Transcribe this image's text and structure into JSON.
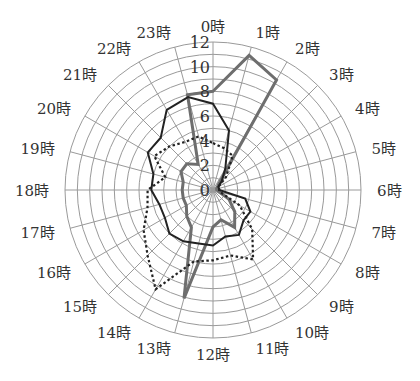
{
  "chart_data": {
    "type": "radar",
    "title": "",
    "categories": [
      "0時",
      "1時",
      "2時",
      "3時",
      "4時",
      "5時",
      "6時",
      "7時",
      "8時",
      "9時",
      "10時",
      "11時",
      "12時",
      "13時",
      "14時",
      "15時",
      "16時",
      "17時",
      "18時",
      "19時",
      "20時",
      "21時",
      "22時",
      "23時"
    ],
    "radial_ticks": [
      0,
      2,
      4,
      6,
      8,
      10,
      12
    ],
    "rlim": [
      0,
      12
    ],
    "grid": true,
    "legend": null,
    "series": [
      {
        "name": "series-gray",
        "style": "solid-thick-gray",
        "color": "#6e6e6e",
        "values": [
          8.0,
          11.3,
          10.3,
          0.6,
          0.4,
          0.3,
          0.3,
          0.5,
          1.5,
          2.5,
          3.5,
          2.5,
          3.0,
          9.1,
          3.5,
          3.0,
          2.5,
          2.5,
          2.5,
          2.5,
          3.0,
          3.0,
          2.4,
          8.0
        ]
      },
      {
        "name": "series-black",
        "style": "solid-black",
        "color": "#222222",
        "values": [
          7.0,
          5.0,
          2.0,
          1.0,
          0.5,
          0.5,
          0.5,
          2.7,
          3.5,
          3.5,
          4.2,
          3.9,
          4.5,
          4.5,
          4.8,
          5.0,
          4.5,
          4.5,
          5.0,
          5.0,
          6.1,
          6.0,
          7.5,
          7.8
        ]
      },
      {
        "name": "series-dotted",
        "style": "dotted-black",
        "color": "#222222",
        "values": [
          3.8,
          3.5,
          3.2,
          1.5,
          0.5,
          0.5,
          0.5,
          0.6,
          2.5,
          4.5,
          6.5,
          5.5,
          5.7,
          6.0,
          9.3,
          7.5,
          6.5,
          5.5,
          5.3,
          4.0,
          5.5,
          5.0,
          4.5,
          4.5
        ]
      }
    ]
  }
}
